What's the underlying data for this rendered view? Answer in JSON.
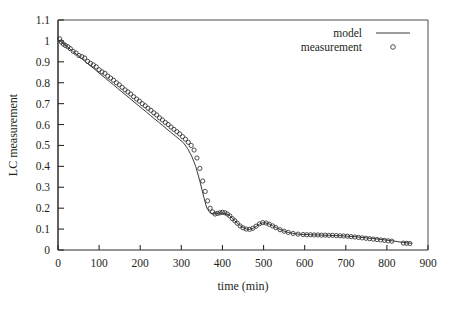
{
  "chart_data": {
    "type": "scatter",
    "title": "",
    "xlabel": "time (min)",
    "ylabel": "LC measurement",
    "xlim": [
      0,
      900
    ],
    "ylim": [
      0,
      1.1
    ],
    "xticks": [
      0,
      100,
      200,
      300,
      400,
      500,
      600,
      700,
      800,
      900
    ],
    "yticks": [
      0,
      0.1,
      0.2,
      0.3,
      0.4,
      0.5,
      0.6,
      0.7,
      0.8,
      0.9,
      1,
      1.1
    ],
    "xtick_labels": [
      "0",
      "100",
      "200",
      "300",
      "400",
      "500",
      "600",
      "700",
      "800",
      "900"
    ],
    "ytick_labels": [
      "0",
      "0.1",
      "0.2",
      "0.3",
      "0.4",
      "0.5",
      "0.6",
      "0.7",
      "0.8",
      "0.9",
      "1",
      "1.1"
    ],
    "grid": false,
    "legend_position": "top-right",
    "legend": [
      {
        "name": "model",
        "symbol": "line"
      },
      {
        "name": "measurement",
        "symbol": "circle"
      }
    ],
    "series": [
      {
        "name": "model",
        "symbol": "line",
        "color": "#3a3a3a",
        "x": [
          5,
          15,
          25,
          35,
          45,
          55,
          65,
          75,
          85,
          95,
          105,
          115,
          125,
          135,
          145,
          155,
          165,
          175,
          185,
          195,
          205,
          215,
          225,
          235,
          245,
          255,
          265,
          275,
          285,
          295,
          305,
          315,
          325,
          335,
          345,
          355,
          362,
          370,
          378,
          386,
          394,
          402,
          410,
          418,
          424,
          430,
          436,
          442,
          450,
          458,
          466,
          474,
          482,
          490,
          498,
          506,
          514,
          522,
          530,
          540,
          550,
          560,
          570,
          580,
          590,
          600,
          615,
          630,
          645,
          660,
          675,
          690,
          705,
          720,
          735,
          750,
          765,
          780,
          800,
          820,
          840,
          860
        ],
        "y": [
          1.0,
          0.985,
          0.968,
          0.952,
          0.936,
          0.92,
          0.903,
          0.887,
          0.871,
          0.855,
          0.838,
          0.822,
          0.806,
          0.79,
          0.773,
          0.757,
          0.741,
          0.725,
          0.708,
          0.692,
          0.676,
          0.66,
          0.643,
          0.627,
          0.611,
          0.595,
          0.578,
          0.562,
          0.546,
          0.53,
          0.513,
          0.486,
          0.45,
          0.4,
          0.33,
          0.25,
          0.2,
          0.178,
          0.172,
          0.174,
          0.178,
          0.176,
          0.172,
          0.164,
          0.152,
          0.14,
          0.128,
          0.118,
          0.107,
          0.1,
          0.099,
          0.103,
          0.113,
          0.124,
          0.13,
          0.129,
          0.124,
          0.116,
          0.108,
          0.098,
          0.09,
          0.084,
          0.08,
          0.077,
          0.075,
          0.074,
          0.073,
          0.072,
          0.071,
          0.07,
          0.069,
          0.068,
          0.066,
          0.064,
          0.061,
          0.058,
          0.055,
          0.052,
          0.047,
          0.042,
          0.036,
          0.032
        ]
      },
      {
        "name": "measurement",
        "symbol": "circle",
        "color": "#2f2f2f",
        "x": [
          4,
          8,
          13,
          18,
          24,
          30,
          37,
          44,
          51,
          58,
          65,
          72,
          79,
          86,
          93,
          100,
          107,
          114,
          121,
          128,
          135,
          142,
          149,
          156,
          163,
          170,
          177,
          184,
          191,
          198,
          205,
          212,
          219,
          226,
          233,
          240,
          247,
          254,
          261,
          268,
          275,
          282,
          289,
          296,
          303,
          310,
          317,
          324,
          331,
          338,
          345,
          352,
          358,
          364,
          370,
          376,
          382,
          388,
          394,
          400,
          406,
          412,
          418,
          424,
          430,
          436,
          443,
          450,
          458,
          466,
          474,
          482,
          490,
          498,
          506,
          514,
          522,
          530,
          540,
          550,
          560,
          572,
          584,
          596,
          605,
          614,
          623,
          632,
          641,
          650,
          659,
          668,
          677,
          686,
          695,
          704,
          713,
          722,
          731,
          740,
          749,
          758,
          767,
          776,
          785,
          794,
          803,
          812,
          840,
          848,
          856
        ],
        "y": [
          1.01,
          0.995,
          0.985,
          0.978,
          0.972,
          0.963,
          0.95,
          0.942,
          0.93,
          0.925,
          0.918,
          0.902,
          0.893,
          0.885,
          0.876,
          0.862,
          0.852,
          0.845,
          0.832,
          0.822,
          0.812,
          0.8,
          0.79,
          0.778,
          0.766,
          0.756,
          0.746,
          0.733,
          0.722,
          0.712,
          0.7,
          0.69,
          0.678,
          0.668,
          0.656,
          0.646,
          0.632,
          0.622,
          0.61,
          0.6,
          0.588,
          0.577,
          0.566,
          0.555,
          0.542,
          0.53,
          0.515,
          0.5,
          0.478,
          0.44,
          0.39,
          0.33,
          0.28,
          0.235,
          0.2,
          0.182,
          0.172,
          0.175,
          0.178,
          0.18,
          0.178,
          0.172,
          0.163,
          0.15,
          0.14,
          0.128,
          0.115,
          0.106,
          0.1,
          0.099,
          0.104,
          0.114,
          0.125,
          0.131,
          0.129,
          0.123,
          0.115,
          0.107,
          0.097,
          0.09,
          0.084,
          0.079,
          0.076,
          0.074,
          0.073,
          0.073,
          0.072,
          0.072,
          0.071,
          0.071,
          0.07,
          0.07,
          0.069,
          0.068,
          0.067,
          0.066,
          0.064,
          0.062,
          0.06,
          0.058,
          0.056,
          0.054,
          0.052,
          0.05,
          0.048,
          0.046,
          0.044,
          0.042,
          0.033,
          0.032,
          0.031
        ]
      }
    ]
  }
}
